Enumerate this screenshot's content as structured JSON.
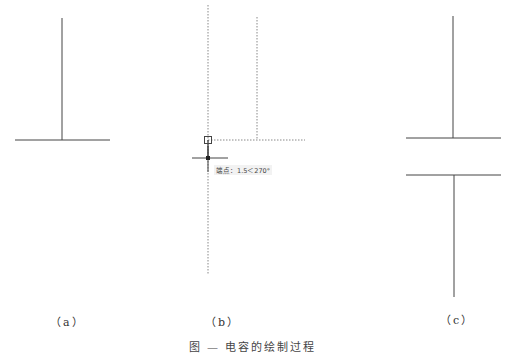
{
  "figure": {
    "caption": "图 — 电容的绘制过程",
    "panels": [
      {
        "id": "a",
        "label": "（a）",
        "description": "vertical lead with bottom plate",
        "lines": [
          {
            "x1": 62,
            "y1": 18,
            "x2": 62,
            "y2": 140,
            "style": "solid"
          },
          {
            "x1": 15,
            "y1": 140,
            "x2": 110,
            "y2": 140,
            "style": "solid"
          }
        ]
      },
      {
        "id": "b",
        "label": "（b）",
        "description": "tracking/snap guides while placing second plate",
        "lines": [
          {
            "x1": 208,
            "y1": 5,
            "x2": 208,
            "y2": 275,
            "style": "dotted"
          },
          {
            "x1": 257,
            "y1": 17,
            "x2": 257,
            "y2": 140,
            "style": "dotted"
          },
          {
            "x1": 208,
            "y1": 140,
            "x2": 305,
            "y2": 140,
            "style": "dotted"
          }
        ],
        "snap_marker": {
          "x": 208,
          "y": 140
        },
        "cursor": {
          "x": 208,
          "y": 158
        },
        "tooltip": "端点：1.5＜270°"
      },
      {
        "id": "c",
        "label": "（c）",
        "description": "completed capacitor symbol",
        "lines": [
          {
            "x1": 453,
            "y1": 16,
            "x2": 453,
            "y2": 138,
            "style": "solid"
          },
          {
            "x1": 406,
            "y1": 138,
            "x2": 501,
            "y2": 138,
            "style": "solid"
          },
          {
            "x1": 406,
            "y1": 175,
            "x2": 501,
            "y2": 175,
            "style": "solid"
          },
          {
            "x1": 454,
            "y1": 175,
            "x2": 454,
            "y2": 297,
            "style": "solid"
          }
        ]
      }
    ],
    "colors": {
      "line": "#333333",
      "guide": "#777777",
      "background": "#ffffff"
    }
  }
}
